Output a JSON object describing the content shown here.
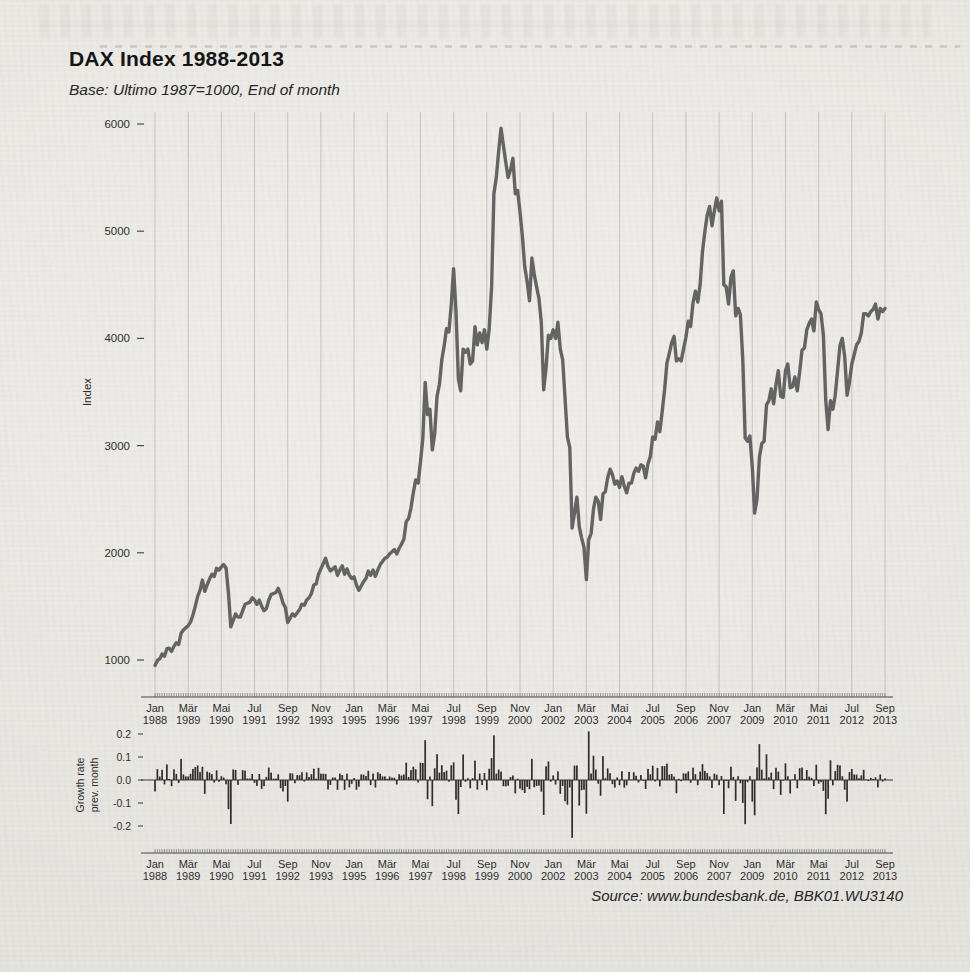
{
  "page": {
    "title": "DAX Index 1988-2013",
    "subtitle": "Base: Ultimo 1987=1000, End of month",
    "source": "Source: www.bundesbank.de, BBK01.WU3140"
  },
  "chart_data": [
    {
      "type": "line",
      "title": "DAX Index 1988-2013",
      "ylabel": "Index",
      "x_start": "Jan 1988",
      "x_end": "Sep 2013",
      "x_tick_interval_months": 14,
      "x_tick_labels": [
        "Jan 1988",
        "Mär 1989",
        "Mai 1990",
        "Jul 1991",
        "Sep 1992",
        "Nov 1993",
        "Jan 1995",
        "Mär 1996",
        "Mai 1997",
        "Jul 1998",
        "Sep 1999",
        "Nov 2000",
        "Jan 2002",
        "Mär 2003",
        "Mai 2004",
        "Jul 2005",
        "Sep 2006",
        "Nov 2007",
        "Jan 2009",
        "Mär 2010",
        "Mai 2011",
        "Jul 2012",
        "Sep 2013"
      ],
      "y_ticks": [
        6000,
        5000,
        4000,
        3000,
        2000,
        1000
      ],
      "ylim": [
        1000,
        6000
      ],
      "grid": "vertical-only",
      "line_color": "#646464",
      "base_value": 1000,
      "values": [
        950,
        995,
        1010,
        1055,
        1035,
        1105,
        1110,
        1080,
        1130,
        1160,
        1145,
        1250,
        1280,
        1300,
        1320,
        1355,
        1420,
        1500,
        1595,
        1650,
        1745,
        1640,
        1700,
        1755,
        1800,
        1780,
        1855,
        1840,
        1870,
        1890,
        1855,
        1620,
        1310,
        1370,
        1430,
        1400,
        1400,
        1460,
        1520,
        1530,
        1540,
        1580,
        1560,
        1520,
        1560,
        1500,
        1460,
        1480,
        1560,
        1610,
        1620,
        1630,
        1670,
        1610,
        1530,
        1490,
        1350,
        1390,
        1430,
        1410,
        1440,
        1470,
        1520,
        1510,
        1560,
        1580,
        1620,
        1700,
        1710,
        1800,
        1850,
        1900,
        1950,
        1870,
        1830,
        1850,
        1870,
        1790,
        1840,
        1880,
        1800,
        1850,
        1790,
        1760,
        1775,
        1700,
        1650,
        1690,
        1730,
        1760,
        1830,
        1790,
        1840,
        1780,
        1840,
        1890,
        1920,
        1950,
        1960,
        1990,
        2010,
        2030,
        1990,
        2040,
        2080,
        2130,
        2290,
        2320,
        2420,
        2560,
        2680,
        2650,
        2850,
        3060,
        3590,
        3290,
        3340,
        2960,
        3110,
        3460,
        3570,
        3800,
        3930,
        4090,
        4060,
        4320,
        4650,
        4250,
        3620,
        3510,
        3900,
        3870,
        3900,
        3760,
        3790,
        4110,
        3940,
        4050,
        3960,
        4080,
        3900,
        4090,
        4480,
        5350,
        5500,
        5750,
        5960,
        5800,
        5640,
        5500,
        5570,
        5680,
        5350,
        5380,
        5180,
        4950,
        4670,
        4530,
        4350,
        4750,
        4600,
        4480,
        4370,
        4150,
        3520,
        3730,
        4030,
        4000,
        4080,
        4000,
        4150,
        3900,
        3800,
        3450,
        3080,
        2980,
        2230,
        2370,
        2520,
        2240,
        2140,
        2050,
        1750,
        2120,
        2180,
        2410,
        2520,
        2480,
        2310,
        2550,
        2570,
        2700,
        2780,
        2730,
        2640,
        2670,
        2610,
        2710,
        2620,
        2560,
        2650,
        2650,
        2740,
        2790,
        2760,
        2820,
        2810,
        2700,
        2830,
        2900,
        3080,
        3060,
        3220,
        3130,
        3320,
        3520,
        3770,
        3860,
        3960,
        4020,
        3790,
        3810,
        3790,
        3900,
        4010,
        4160,
        4110,
        4330,
        4440,
        4340,
        4500,
        4810,
        5000,
        5150,
        5230,
        5050,
        5190,
        5310,
        5190,
        5280,
        4500,
        4480,
        4320,
        4570,
        4630,
        4210,
        4280,
        4220,
        3800,
        3070,
        3040,
        3090,
        2800,
        2370,
        2500,
        2890,
        3020,
        3040,
        3380,
        3420,
        3530,
        3390,
        3570,
        3700,
        3460,
        3450,
        3700,
        3760,
        3540,
        3550,
        3640,
        3510,
        3690,
        3890,
        3910,
        4080,
        4140,
        4180,
        4070,
        4340,
        4270,
        4230,
        4030,
        3430,
        3150,
        3420,
        3340,
        3470,
        3700,
        3935,
        4000,
        3830,
        3470,
        3590,
        3760,
        3850,
        3940,
        3970,
        4050,
        4230,
        4230,
        4210,
        4250,
        4270,
        4320,
        4180,
        4280,
        4250,
        4280
      ]
    },
    {
      "type": "bar",
      "ylabel_lines": [
        "Growth rate",
        "prev. month"
      ],
      "y_ticks": [
        "0.2",
        "0.1",
        "0.0",
        "-0.1",
        "-0.2"
      ],
      "y_tick_values": [
        0.2,
        0.1,
        0.0,
        -0.1,
        -0.2
      ],
      "ylim": [
        -0.26,
        0.22
      ],
      "x_tick_labels": [
        "Jan 1988",
        "Mär 1989",
        "Mai 1990",
        "Jul 1991",
        "Sep 1992",
        "Nov 1993",
        "Jan 1995",
        "Mär 1996",
        "Mai 1997",
        "Jul 1998",
        "Sep 1999",
        "Nov 2000",
        "Jan 2002",
        "Mär 2003",
        "Mai 2004",
        "Jul 2005",
        "Sep 2006",
        "Nov 2007",
        "Jan 2009",
        "Mär 2010",
        "Mai 2011",
        "Jul 2012",
        "Sep 2013"
      ],
      "bar_color": "#2d2d2d",
      "values_note": "growth[m] = index[m] / index[m-1] - 1, with index[-1] = base_value 1000; computed from the line-chart values above"
    }
  ]
}
